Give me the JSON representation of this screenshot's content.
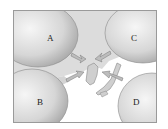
{
  "diagram": {
    "title": "",
    "air_masses": [
      {
        "id": "A",
        "label": "A",
        "position": "northwest"
      },
      {
        "id": "B",
        "label": "B",
        "position": "southwest"
      },
      {
        "id": "C",
        "label": "C",
        "position": "northeast"
      },
      {
        "id": "D",
        "label": "D",
        "position": "southeast"
      }
    ],
    "center_region": "Korean peninsula",
    "colors": {
      "air_mass_fill": "#c8c8c8",
      "air_mass_highlight": "#f2f2f2",
      "land": "#cfcfcf",
      "sea": "#ffffff",
      "frame": "#9a9a9a"
    }
  }
}
